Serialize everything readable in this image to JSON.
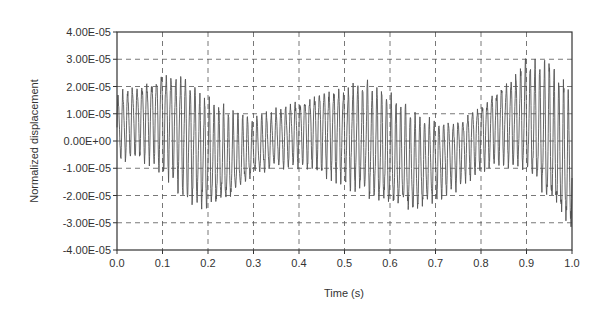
{
  "chart_data": {
    "type": "line",
    "title": "",
    "xlabel": "Time (s)",
    "ylabel": "Normalized displacement",
    "xlim": [
      0.0,
      1.0
    ],
    "ylim": [
      -4e-05,
      4e-05
    ],
    "x_ticks": [
      "0.0",
      "0.1",
      "0.2",
      "0.3",
      "0.4",
      "0.5",
      "0.6",
      "0.7",
      "0.8",
      "0.9",
      "1.0"
    ],
    "y_ticks": [
      "4.00E-05",
      "3.00E-05",
      "2.00E-05",
      "1.00E-05",
      "0.00E+00",
      "-1.00E-05",
      "-2.00E-05",
      "-3.00E-05",
      "-4.00E-05"
    ],
    "grid": true,
    "grid_style": "dashed",
    "legend": null,
    "series": [
      {
        "name": "Normalized displacement",
        "description": "High-frequency oscillation (~90 Hz) with slowly varying mean/envelope; amplitude roughly ±2.5E-05 peak",
        "envelope_x": [
          0.0,
          0.05,
          0.1,
          0.15,
          0.2,
          0.25,
          0.3,
          0.35,
          0.4,
          0.45,
          0.5,
          0.55,
          0.6,
          0.65,
          0.7,
          0.75,
          0.8,
          0.85,
          0.9,
          0.95,
          1.0
        ],
        "envelope_upper": [
          1.8e-05,
          2.2e-05,
          2.7e-05,
          2.5e-05,
          1.5e-05,
          1e-05,
          8e-06,
          1.2e-05,
          1.6e-05,
          2e-05,
          2.1e-05,
          2.2e-05,
          1.6e-05,
          1e-05,
          8e-06,
          9e-06,
          1.5e-05,
          2.2e-05,
          2.9e-05,
          2.8e-05,
          1.5e-05
        ],
        "envelope_lower": [
          -8e-06,
          -6e-06,
          -1e-05,
          -2.2e-05,
          -2.7e-05,
          -2.3e-05,
          -1.4e-05,
          -1e-05,
          -9e-06,
          -1.1e-05,
          -1.6e-05,
          -2.2e-05,
          -2.6e-05,
          -2.8e-05,
          -2.2e-05,
          -1.7e-05,
          -1e-05,
          -8e-06,
          -1.3e-05,
          -2.6e-05,
          -3.6e-05
        ]
      }
    ]
  }
}
